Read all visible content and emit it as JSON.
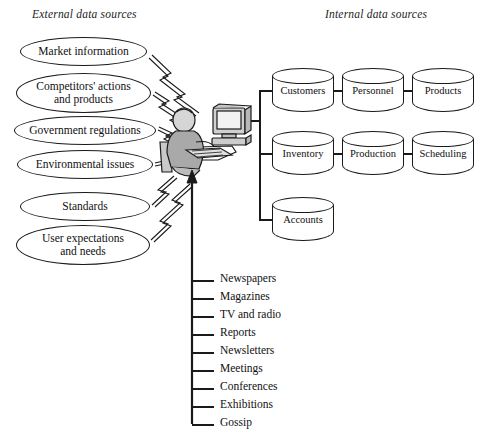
{
  "diagram": {
    "title_external": "External data sources",
    "title_internal": "Internal data sources",
    "stroke_color": "#1a1a1a",
    "background": "#ffffff",
    "external_sources": [
      {
        "label": "Market information",
        "lines": [
          "Market information"
        ]
      },
      {
        "label": "Competitors' actions and products",
        "lines": [
          "Competitors' actions",
          "and products"
        ]
      },
      {
        "label": "Government regulations",
        "lines": [
          "Government regulations"
        ]
      },
      {
        "label": "Environmental issues",
        "lines": [
          "Environmental issues"
        ]
      },
      {
        "label": "Standards",
        "lines": [
          "Standards"
        ]
      },
      {
        "label": "User expectations and needs",
        "lines": [
          "User expectations",
          "and needs"
        ]
      }
    ],
    "internal_sources": [
      {
        "label": "Customers",
        "row": 1
      },
      {
        "label": "Personnel",
        "row": 1
      },
      {
        "label": "Products",
        "row": 1
      },
      {
        "label": "Inventory",
        "row": 2
      },
      {
        "label": "Production",
        "row": 2
      },
      {
        "label": "Scheduling",
        "row": 2
      },
      {
        "label": "Accounts",
        "row": 3
      }
    ],
    "media_channels": [
      "Newspapers",
      "Magazines",
      "TV and radio",
      "Reports",
      "Newsletters",
      "Meetings",
      "Conferences",
      "Exhibitions",
      "Gossip"
    ],
    "center_figure": "person-at-computer-workstation"
  }
}
